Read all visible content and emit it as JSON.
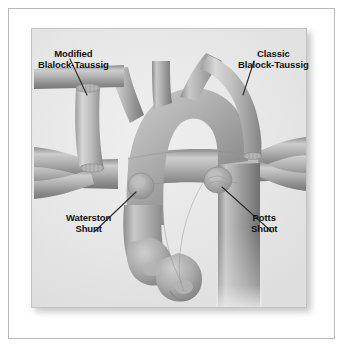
{
  "figure": {
    "type": "medical-illustration",
    "view": "anterior view of aortic arch, pulmonary arteries and descending aorta"
  },
  "labels": {
    "modified_bt": {
      "line1": "Modified",
      "line2": "Blalock-Taussig"
    },
    "classic_bt": {
      "line1": "Classic",
      "line2": "Blalock-Taussig"
    },
    "waterston": {
      "line1": "Waterston",
      "line2": "Shunt"
    },
    "potts": {
      "line1": "Potts",
      "line2": "Shunt"
    }
  },
  "colors": {
    "page_background": "#ffffff",
    "frame_rule": "#b9b9b9",
    "panel_background": "#e9e9e9",
    "panel_border": "#c3c3c3",
    "vessel_mid": "#a8a8a8",
    "vessel_light": "#d2d2d2",
    "vessel_dark": "#7e7e7e",
    "graft_light": "#c6c6c6",
    "label_text": "#121212",
    "leader_line": "#2a2a2a"
  },
  "anatomy": {
    "structures": [
      "ascending aorta",
      "aortic arch",
      "brachiocephalic trunk",
      "left common carotid artery",
      "left subclavian artery",
      "right subclavian artery",
      "descending thoracic aorta",
      "main pulmonary artery",
      "right pulmonary artery",
      "left pulmonary artery"
    ]
  },
  "shunts": [
    {
      "name": "Modified Blalock-Taussig",
      "description": "prosthetic interposition tube graft between right subclavian artery and right pulmonary artery",
      "position": "upper left"
    },
    {
      "name": "Classic Blalock-Taussig",
      "description": "divided subclavian artery turned down and anastomosed end-to-side to the pulmonary artery",
      "position": "upper right"
    },
    {
      "name": "Waterston Shunt",
      "description": "side-to-side anastomosis between ascending aorta and right pulmonary artery",
      "position": "center left"
    },
    {
      "name": "Potts Shunt",
      "description": "side-to-side anastomosis between descending aorta and left pulmonary artery",
      "position": "center right"
    }
  ]
}
